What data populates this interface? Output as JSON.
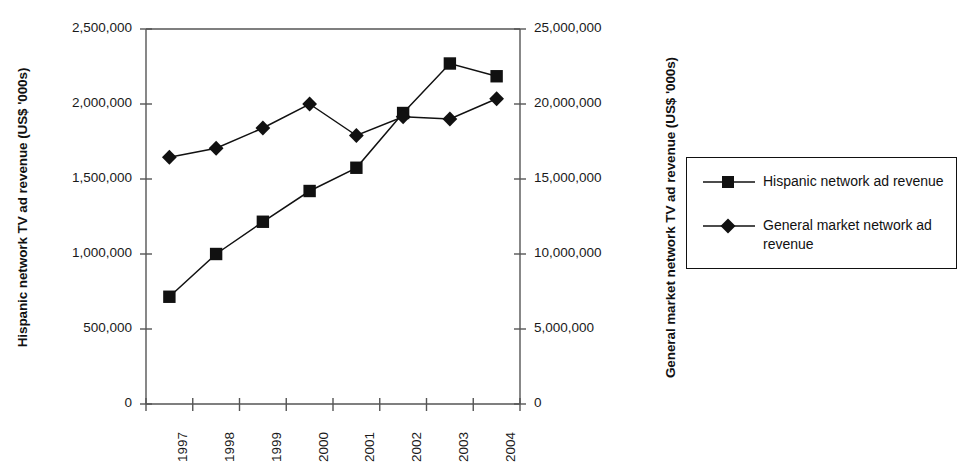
{
  "chart_data": {
    "type": "line",
    "title": "",
    "xlabel": "",
    "categories": [
      "1997",
      "1998",
      "1999",
      "2000",
      "2001",
      "2002",
      "2003",
      "2004"
    ],
    "grid": false,
    "legend_position": "right",
    "axes": {
      "left": {
        "label": "Hispanic network TV ad revenue (US$ '000s)",
        "ticks": [
          "0",
          "500,000",
          "1,000,000",
          "1,500,000",
          "2,000,000",
          "2,500,000"
        ],
        "tick_values": [
          0,
          500000,
          1000000,
          1500000,
          2000000,
          2500000
        ],
        "ylim": [
          0,
          2500000
        ]
      },
      "right": {
        "label": "General market network TV ad revenue (US$ '000s)",
        "ticks": [
          "0",
          "5,000,000",
          "10,000,000",
          "15,000,000",
          "20,000,000",
          "25,000,000"
        ],
        "tick_values": [
          0,
          5000000,
          10000000,
          15000000,
          20000000,
          25000000
        ],
        "ylim": [
          0,
          25000000
        ]
      }
    },
    "series": [
      {
        "name": "Hispanic network ad revenue",
        "axis": "left",
        "marker": "square",
        "color": "#111111",
        "values": [
          715000,
          1000000,
          1215000,
          1420000,
          1575000,
          1940000,
          2270000,
          2185000
        ]
      },
      {
        "name": "General market network ad revenue",
        "axis": "right",
        "marker": "diamond",
        "color": "#111111",
        "values": [
          16450000,
          17050000,
          18400000,
          20000000,
          17900000,
          19150000,
          19000000,
          20350000
        ]
      }
    ]
  },
  "legend": {
    "entries": [
      {
        "label": "Hispanic network ad revenue",
        "marker": "square"
      },
      {
        "label": "General market network ad revenue",
        "marker": "diamond"
      }
    ]
  }
}
